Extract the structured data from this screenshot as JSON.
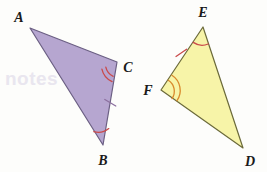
{
  "figure": {
    "background_color": "#fdfdfb",
    "width": 267,
    "height": 172,
    "triangles": [
      {
        "id": "triangle-abc",
        "name": "Triangle ABC",
        "fill_color": "#b6a6d0",
        "stroke_color": "#6b5f83",
        "stroke_width": 1.2,
        "points": "30,28 103,145 117,62",
        "vertices": [
          {
            "key": "A",
            "label": "A",
            "point_x": 30,
            "point_y": 28,
            "label_x": 19,
            "label_y": 22
          },
          {
            "key": "B",
            "label": "B",
            "point_x": 103,
            "point_y": 145,
            "label_x": 100,
            "label_y": 165
          },
          {
            "key": "C",
            "label": "C",
            "point_x": 117,
            "point_y": 62,
            "label_x": 124,
            "label_y": 72
          }
        ],
        "angle_marks": [
          {
            "at": "C",
            "arcs": 2,
            "color": "#c94a4a",
            "name": "angle-mark-c-double-arc"
          },
          {
            "at": "B",
            "arcs": 1,
            "color": "#c94a4a",
            "name": "angle-mark-b-single-arc"
          }
        ],
        "tick_marks": [
          {
            "on": "BC",
            "count": 1,
            "color": "#8b6f9e",
            "name": "tick-mark-bc"
          }
        ]
      },
      {
        "id": "triangle-def",
        "name": "Triangle DEF",
        "fill_color": "#f7f4a8",
        "stroke_color": "#6b6a3a",
        "stroke_width": 1.2,
        "points": "203,27 243,148 161,90",
        "vertices": [
          {
            "key": "E",
            "label": "E",
            "point_x": 203,
            "point_y": 27,
            "label_x": 199,
            "label_y": 17
          },
          {
            "key": "D",
            "label": "D",
            "point_x": 243,
            "point_y": 148,
            "label_x": 246,
            "label_y": 165
          },
          {
            "key": "F",
            "label": "F",
            "point_x": 161,
            "point_y": 90,
            "label_x": 146,
            "label_y": 94
          }
        ],
        "angle_marks": [
          {
            "at": "E",
            "arcs": 1,
            "color": "#c94a4a",
            "name": "angle-mark-e-single-arc"
          },
          {
            "at": "F",
            "arcs": 2,
            "color": "#d9892c",
            "name": "angle-mark-f-double-arc"
          }
        ],
        "tick_marks": [
          {
            "on": "EF",
            "count": 1,
            "color": "#c94a4a",
            "name": "tick-mark-ef"
          }
        ]
      }
    ],
    "ghost_artifact": {
      "visible": true,
      "text": "notes",
      "x": 5,
      "y": 68
    }
  }
}
